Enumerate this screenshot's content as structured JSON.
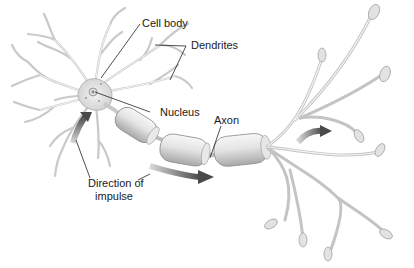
{
  "diagram": {
    "labels": {
      "cell_body": "Cell body",
      "dendrites": "Dendrites",
      "nucleus": "Nucleus",
      "axon": "Axon",
      "direction_line1": "Direction of",
      "direction_line2": "impulse"
    },
    "colors": {
      "background": "#ffffff",
      "structure_fill": "#e6e6e6",
      "structure_stroke": "#9a9a9a",
      "arrow": "#5a5a5a",
      "text": "#1a1a1a"
    }
  }
}
